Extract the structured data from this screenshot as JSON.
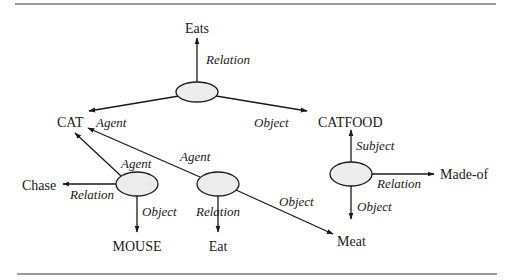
{
  "diagram": {
    "type": "semantic-network",
    "nodes": {
      "eats": "Eats",
      "cat": "CAT",
      "catfood": "CATFOOD",
      "chase": "Chase",
      "mouse": "MOUSE",
      "eat": "Eat",
      "meat": "Meat",
      "made_of": "Made-of"
    },
    "edge_labels": {
      "top_relation": "Relation",
      "top_agent": "Agent",
      "top_object": "Object",
      "left_agent": "Agent",
      "left_relation": "Relation",
      "left_object": "Object",
      "mid_agent": "Agent",
      "mid_relation": "Relation",
      "mid_object": "Object",
      "right_subject": "Subject",
      "right_relation": "Relation",
      "right_object": "Object"
    },
    "edges": [
      {
        "from": "event-eats",
        "to": "Eats",
        "label": "Relation"
      },
      {
        "from": "event-eats",
        "to": "CAT",
        "label": "Agent"
      },
      {
        "from": "event-eats",
        "to": "CATFOOD",
        "label": "Object"
      },
      {
        "from": "event-chase",
        "to": "CAT",
        "label": "Agent"
      },
      {
        "from": "event-chase",
        "to": "Chase",
        "label": "Relation"
      },
      {
        "from": "event-chase",
        "to": "MOUSE",
        "label": "Object"
      },
      {
        "from": "event-eat",
        "to": "CAT",
        "label": "Agent"
      },
      {
        "from": "event-eat",
        "to": "Eat",
        "label": "Relation"
      },
      {
        "from": "event-eat",
        "to": "Meat",
        "label": "Object"
      },
      {
        "from": "event-madeof",
        "to": "CATFOOD",
        "label": "Subject"
      },
      {
        "from": "event-madeof",
        "to": "Made-of",
        "label": "Relation"
      },
      {
        "from": "event-madeof",
        "to": "Meat",
        "label": "Object"
      }
    ],
    "colors": {
      "node_fill": "#ececec",
      "stroke": "#1a1a1a",
      "rule": "#7a7a7a"
    }
  }
}
